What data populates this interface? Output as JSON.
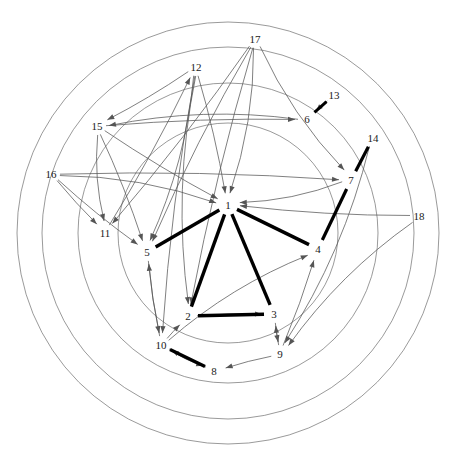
{
  "figure": {
    "title": "",
    "type": "directed-graph-on-concentric-circles",
    "background_color": "#ffffff",
    "line_color_thin": "#555555",
    "line_color_thick": "#000000",
    "circle_color": "#6e6e6e",
    "label_color": "#1a1a1a"
  },
  "circles": {
    "center": {
      "x": 228,
      "y": 233
    },
    "radii": [
      211,
      186,
      150,
      110
    ],
    "stroke_width": 0.7
  },
  "nodes": [
    {
      "id": "1",
      "label": "1",
      "x": 228,
      "y": 205
    },
    {
      "id": "2",
      "label": "2",
      "x": 188,
      "y": 316
    },
    {
      "id": "3",
      "label": "3",
      "x": 274,
      "y": 314
    },
    {
      "id": "4",
      "label": "4",
      "x": 318,
      "y": 249
    },
    {
      "id": "5",
      "label": "5",
      "x": 147,
      "y": 252
    },
    {
      "id": "6",
      "label": "6",
      "x": 307,
      "y": 119
    },
    {
      "id": "7",
      "label": "7",
      "x": 351,
      "y": 180
    },
    {
      "id": "8",
      "label": "8",
      "x": 214,
      "y": 371
    },
    {
      "id": "9",
      "label": "9",
      "x": 280,
      "y": 354
    },
    {
      "id": "10",
      "label": "10",
      "x": 161,
      "y": 345
    },
    {
      "id": "11",
      "label": "11",
      "x": 105,
      "y": 233
    },
    {
      "id": "12",
      "label": "12",
      "x": 196,
      "y": 67
    },
    {
      "id": "13",
      "label": "13",
      "x": 334,
      "y": 95
    },
    {
      "id": "14",
      "label": "14",
      "x": 373,
      "y": 138
    },
    {
      "id": "15",
      "label": "15",
      "x": 97,
      "y": 126
    },
    {
      "id": "16",
      "label": "16",
      "x": 51,
      "y": 174
    },
    {
      "id": "17",
      "label": "17",
      "x": 255,
      "y": 39
    },
    {
      "id": "18",
      "label": "18",
      "x": 419,
      "y": 216
    }
  ],
  "thick_edges": [
    {
      "from": "1",
      "to": "5",
      "width": 3.4
    },
    {
      "from": "1",
      "to": "2",
      "width": 3.4
    },
    {
      "from": "1",
      "to": "3",
      "width": 3.4
    },
    {
      "from": "1",
      "to": "4",
      "width": 3.4
    },
    {
      "from": "2",
      "to": "3",
      "width": 3.4
    },
    {
      "from": "10",
      "to": "8",
      "width": 3.4
    },
    {
      "from": "13",
      "to": "6",
      "width": 3.0
    },
    {
      "from": "14",
      "to": "7",
      "width": 3.2
    },
    {
      "from": "7",
      "to": "4",
      "width": 3.2
    }
  ],
  "thin_edges": [
    {
      "from": "17",
      "to": "1"
    },
    {
      "from": "17",
      "to": "5"
    },
    {
      "from": "17",
      "to": "2"
    },
    {
      "from": "17",
      "to": "11"
    },
    {
      "from": "12",
      "to": "1"
    },
    {
      "from": "12",
      "to": "2"
    },
    {
      "from": "12",
      "to": "5"
    },
    {
      "from": "12",
      "to": "10"
    },
    {
      "from": "15",
      "to": "1"
    },
    {
      "from": "15",
      "to": "6"
    },
    {
      "from": "15",
      "to": "5"
    },
    {
      "from": "15",
      "to": "11"
    },
    {
      "from": "16",
      "to": "1"
    },
    {
      "from": "16",
      "to": "5"
    },
    {
      "from": "16",
      "to": "11"
    },
    {
      "from": "16",
      "to": "7"
    },
    {
      "from": "18",
      "to": "1"
    },
    {
      "from": "18",
      "to": "9"
    },
    {
      "from": "14",
      "to": "9"
    },
    {
      "from": "13",
      "to": "6"
    },
    {
      "from": "11",
      "to": "12"
    },
    {
      "from": "10",
      "to": "2"
    },
    {
      "from": "10",
      "to": "5"
    },
    {
      "from": "10",
      "to": "8"
    },
    {
      "from": "10",
      "to": "4"
    },
    {
      "from": "9",
      "to": "8"
    },
    {
      "from": "9",
      "to": "4"
    },
    {
      "from": "9",
      "to": "3"
    },
    {
      "from": "2",
      "to": "3"
    },
    {
      "from": "6",
      "to": "15"
    },
    {
      "from": "7",
      "to": "1"
    },
    {
      "from": "5",
      "to": "10"
    },
    {
      "from": "3",
      "to": "9"
    },
    {
      "from": "8",
      "to": "10"
    },
    {
      "from": "12",
      "to": "15"
    },
    {
      "from": "17",
      "to": "7"
    }
  ],
  "arrowhead": {
    "length": 7,
    "half_width": 2.6
  }
}
